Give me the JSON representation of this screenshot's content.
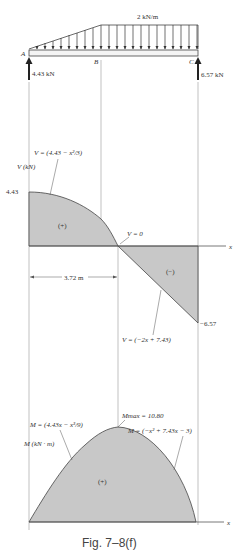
{
  "figure": {
    "caption": "Fig. 7–8(f)"
  },
  "beam": {
    "points": [
      "A",
      "B",
      "C"
    ],
    "distributed_load_label": "2 kN/m",
    "reaction_A": "4.43 kN",
    "reaction_C": "6.57 kN"
  },
  "shear_diagram": {
    "axis_label_y": "V (kN)",
    "axis_label_x": "x",
    "max_value_label": "4.43",
    "min_value_label": "−6.57",
    "region_positive": "(+)",
    "region_negative": "(−)",
    "zero_label": "V = 0",
    "zero_distance_label": "3.72 m",
    "eq_segment1": "V = (4.43 − x²/3)",
    "eq_segment2": "V = (−2x + 7.43)"
  },
  "moment_diagram": {
    "axis_label_y": "M (kN · m)",
    "axis_label_x": "x",
    "region_positive": "(+)",
    "max_label": "Mmax = 10.80",
    "eq_segment1": "M = (4.43x − x³/9)",
    "eq_segment2": "M = (−x² + 7.43x − 3)"
  },
  "colors": {
    "fill": "#c8c8c8",
    "line": "#444444"
  }
}
